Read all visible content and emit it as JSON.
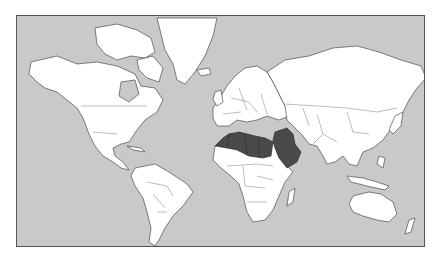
{
  "map": {
    "projection": "mercator",
    "style": "world political outline map",
    "colors": {
      "ocean": "#c9c9c9",
      "land": "#ffffff",
      "highlighted": "#4a4a4a",
      "border": "#333333"
    },
    "highlighted_countries": [
      "Morocco",
      "Algeria",
      "Tunisia",
      "Libya",
      "Egypt",
      "Syria",
      "Iraq",
      "Jordan",
      "Saudi Arabia"
    ],
    "highlighted_region": "North Africa and Middle East"
  }
}
